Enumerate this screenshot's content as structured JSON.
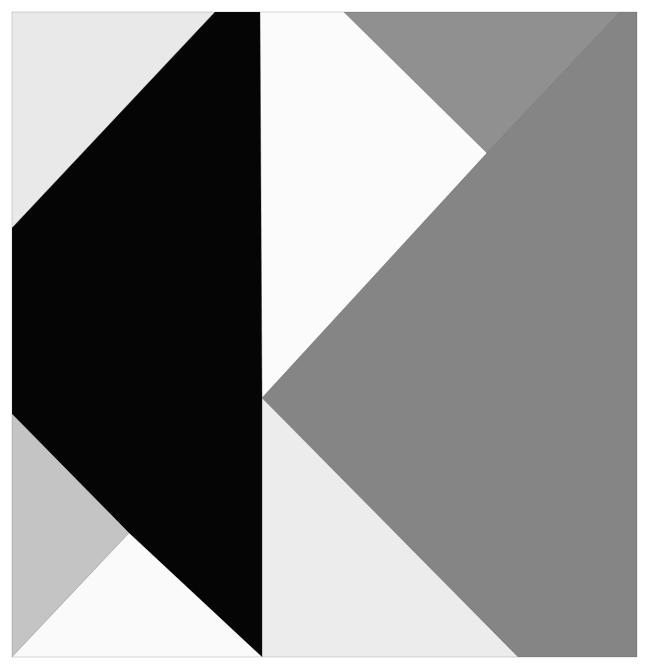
{
  "artwork": {
    "width": 645,
    "height": 668,
    "background": "#ffffff",
    "shapes": [
      {
        "name": "top-left-offwhite-panel",
        "fill": "#e9e9e9",
        "points": "12,12 215,12 12,228"
      },
      {
        "name": "center-white-panel",
        "fill": "#fbfbfb",
        "points": "260,12 344,12 487,153 262,398"
      },
      {
        "name": "top-right-gray-triangle",
        "fill": "#909090",
        "points": "344,12 620,12 487,153"
      },
      {
        "name": "right-gray-kite",
        "fill": "#858585",
        "points": "620,12 637,12 637,657 518,657 262,398 487,153"
      },
      {
        "name": "bottom-center-offwhite-triangle",
        "fill": "#ececec",
        "points": "262,398 518,657 262,657"
      },
      {
        "name": "black-band",
        "fill": "#050505",
        "points": "215,12 260,12 262,398 262,657 129,533 12,414 12,228"
      },
      {
        "name": "bottom-left-lightgray-triangle",
        "fill": "#c4c4c4",
        "points": "12,414 129,533 12,657"
      },
      {
        "name": "bottom-left-white-triangle",
        "fill": "#fafafa",
        "points": "129,533 262,657 12,657"
      }
    ],
    "edge_color": "#3a3a3a"
  }
}
